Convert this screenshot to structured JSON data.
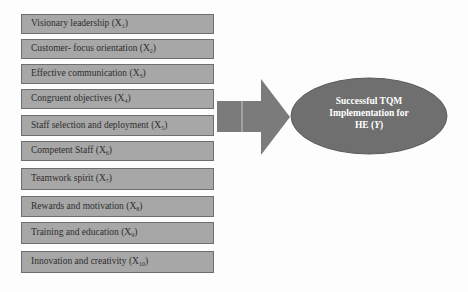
{
  "diagram": {
    "type": "conceptual-framework",
    "factors": [
      {
        "label": "Visionary leadership",
        "var": "X",
        "sub": "1",
        "top": 14,
        "height": 20
      },
      {
        "label": "Customer- focus orientation",
        "var": "X",
        "sub": "2",
        "top": 39,
        "height": 20
      },
      {
        "label": "Effective communication",
        "var": "X",
        "sub": "3",
        "top": 64,
        "height": 20
      },
      {
        "label": "Congruent objectives",
        "var": "X",
        "sub": "4",
        "top": 89,
        "height": 20
      },
      {
        "label": "Staff selection and deployment",
        "var": "X",
        "sub": "5",
        "top": 115,
        "height": 21
      },
      {
        "label": "Competent Staff",
        "var": "X",
        "sub": "6",
        "top": 141,
        "height": 20
      },
      {
        "label": " Teamwork spirit",
        "var": "X",
        "sub": "7",
        "top": 168,
        "height": 22
      },
      {
        "label": "Rewards and motivation ",
        "var": "X",
        "sub": "8",
        "top": 196,
        "height": 21
      },
      {
        "label": "Training and education ",
        "var": "X",
        "sub": "9",
        "top": 222,
        "height": 22
      },
      {
        "label": "Innovation and creativity",
        "var": "X",
        "sub": "10",
        "top": 251,
        "height": 22
      }
    ],
    "arrow": {
      "direction": "right",
      "color": "#7b7b7b"
    },
    "outcome": {
      "line1": "Successful TQM",
      "line2": "Implementation for",
      "line3_prefix": "HE (",
      "line3_var": "Y",
      "line3_suffix": ")",
      "fill": "#6f6f6f",
      "stroke": "#5a5a5a"
    }
  }
}
